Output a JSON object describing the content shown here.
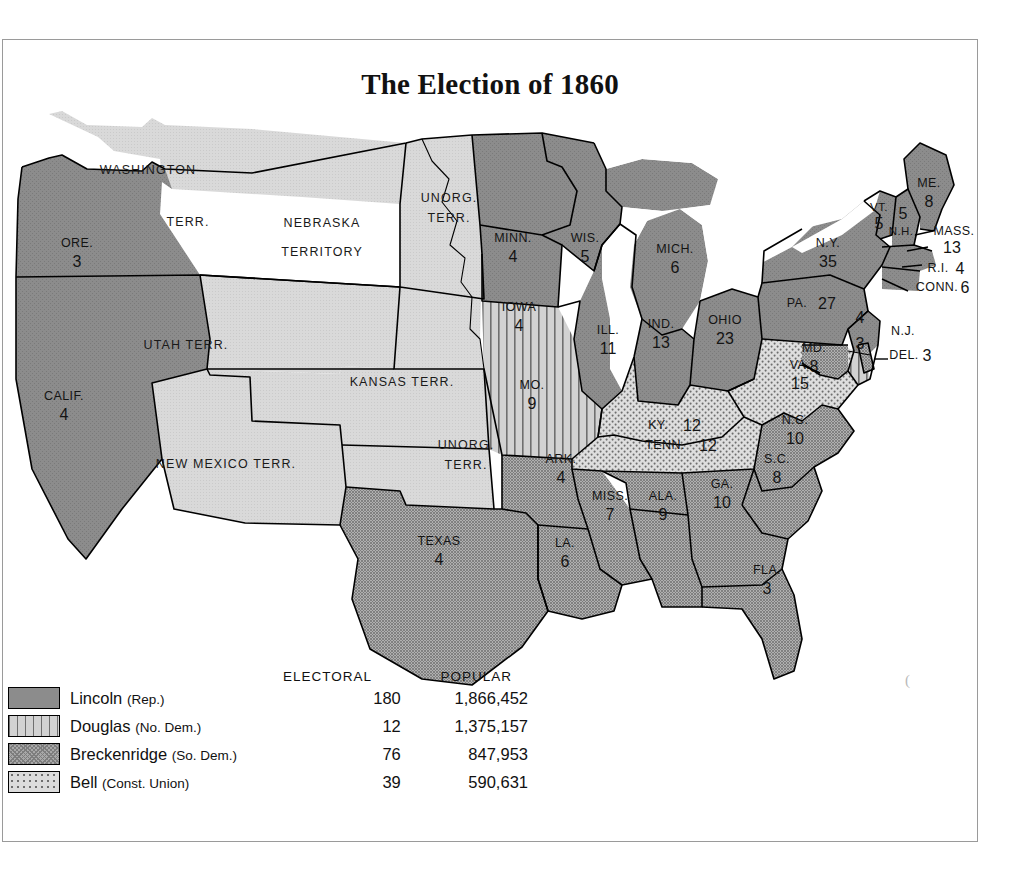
{
  "title": "The Election of 1860",
  "legend": {
    "headers": {
      "electoral": "ELECTORAL",
      "popular": "POPULAR"
    },
    "rows": [
      {
        "candidate": "Lincoln",
        "party": "(Rep.)",
        "electoral": "180",
        "popular": "1,866,452",
        "pattern": "solid-dark-gray"
      },
      {
        "candidate": "Douglas",
        "party": "(No. Dem.)",
        "electoral": "12",
        "popular": "1,375,157",
        "pattern": "vertical-stripes"
      },
      {
        "candidate": "Breckenridge",
        "party": "(So. Dem.)",
        "electoral": "76",
        "popular": "847,953",
        "pattern": "crosshatch"
      },
      {
        "candidate": "Bell",
        "party": "(Const. Union)",
        "electoral": "39",
        "popular": "590,631",
        "pattern": "light-dots"
      }
    ]
  },
  "colors": {
    "lincoln": "#8c8c8c",
    "douglas": "#d2d2d2",
    "breckenridge": "#a8a8a8",
    "bell": "#dcdcdc",
    "territory": "#d6d6d6",
    "water": "#ffffff",
    "border": "#000000"
  },
  "map": {
    "states": [
      {
        "id": "calif",
        "label": "CALIF.",
        "votes": "4",
        "winner": "lincoln"
      },
      {
        "id": "oregon",
        "label": "ORE.",
        "votes": "3",
        "winner": "lincoln"
      },
      {
        "id": "minn",
        "label": "MINN.",
        "votes": "4",
        "winner": "lincoln"
      },
      {
        "id": "iowa",
        "label": "IOWA",
        "votes": "4",
        "winner": "lincoln"
      },
      {
        "id": "wis",
        "label": "WIS.",
        "votes": "5",
        "winner": "lincoln"
      },
      {
        "id": "mich",
        "label": "MICH.",
        "votes": "6",
        "winner": "lincoln"
      },
      {
        "id": "ill",
        "label": "ILL.",
        "votes": "11",
        "winner": "lincoln"
      },
      {
        "id": "ind",
        "label": "IND.",
        "votes": "13",
        "winner": "lincoln"
      },
      {
        "id": "ohio",
        "label": "OHIO",
        "votes": "23",
        "winner": "lincoln"
      },
      {
        "id": "pa",
        "label": "PA.",
        "votes": "27",
        "winner": "lincoln"
      },
      {
        "id": "ny",
        "label": "N.Y.",
        "votes": "35",
        "winner": "lincoln"
      },
      {
        "id": "vt",
        "label": "VT.",
        "votes": "5",
        "winner": "lincoln"
      },
      {
        "id": "nh",
        "label": "N.H.",
        "votes": "5",
        "winner": "lincoln"
      },
      {
        "id": "me",
        "label": "ME.",
        "votes": "8",
        "winner": "lincoln"
      },
      {
        "id": "mass",
        "label": "MASS.",
        "votes": "13",
        "winner": "lincoln"
      },
      {
        "id": "ri",
        "label": "R.I.",
        "votes": "4",
        "winner": "lincoln"
      },
      {
        "id": "conn",
        "label": "CONN.",
        "votes": "6",
        "winner": "lincoln"
      },
      {
        "id": "nj",
        "label": "N.J.",
        "votes": "4",
        "winner": "lincoln",
        "split_votes": "3",
        "split_winner": "douglas"
      },
      {
        "id": "del",
        "label": "DEL.",
        "votes": "3",
        "winner": "breckenridge"
      },
      {
        "id": "md",
        "label": "MD.",
        "votes": "8",
        "winner": "breckenridge"
      },
      {
        "id": "mo",
        "label": "MO.",
        "votes": "9",
        "winner": "douglas"
      },
      {
        "id": "va",
        "label": "VA.",
        "votes": "15",
        "winner": "bell"
      },
      {
        "id": "ky",
        "label": "KY.",
        "votes": "12",
        "winner": "bell"
      },
      {
        "id": "tenn",
        "label": "TENN.",
        "votes": "12",
        "winner": "bell"
      },
      {
        "id": "nc",
        "label": "N.C.",
        "votes": "10",
        "winner": "breckenridge"
      },
      {
        "id": "sc",
        "label": "S.C.",
        "votes": "8",
        "winner": "breckenridge"
      },
      {
        "id": "ga",
        "label": "GA.",
        "votes": "10",
        "winner": "breckenridge"
      },
      {
        "id": "fla",
        "label": "FLA.",
        "votes": "3",
        "winner": "breckenridge"
      },
      {
        "id": "ala",
        "label": "ALA.",
        "votes": "9",
        "winner": "breckenridge"
      },
      {
        "id": "miss",
        "label": "MISS.",
        "votes": "7",
        "winner": "breckenridge"
      },
      {
        "id": "la",
        "label": "LA.",
        "votes": "6",
        "winner": "breckenridge"
      },
      {
        "id": "ark",
        "label": "ARK.",
        "votes": "4",
        "winner": "breckenridge"
      },
      {
        "id": "texas",
        "label": "TEXAS",
        "votes": "4",
        "winner": "breckenridge"
      }
    ],
    "territories": [
      {
        "id": "washington",
        "line1": "WASHINGTON",
        "line2": "TERR."
      },
      {
        "id": "utah",
        "line1": "UTAH  TERR.",
        "line2": ""
      },
      {
        "id": "nebraska",
        "line1": "NEBRASKA",
        "line2": "TERRITORY"
      },
      {
        "id": "unorg-north",
        "line1": "UNORG.",
        "line2": "TERR."
      },
      {
        "id": "kansas",
        "line1": "KANSAS TERR.",
        "line2": ""
      },
      {
        "id": "newmexico",
        "line1": "NEW MEXICO TERR.",
        "line2": ""
      },
      {
        "id": "unorg-south",
        "line1": "UNORG.",
        "line2": "TERR."
      }
    ]
  }
}
